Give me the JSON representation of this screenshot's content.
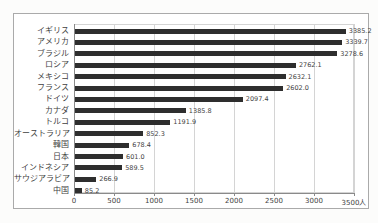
{
  "chart_data": {
    "type": "bar",
    "orientation": "horizontal",
    "title": "",
    "xlabel": "",
    "ylabel": "",
    "categories": [
      "イギリス",
      "アメリカ",
      "ブラジル",
      "ロシア",
      "メキシコ",
      "フランス",
      "ドイツ",
      "カナダ",
      "トルコ",
      "オーストラリア",
      "韓国",
      "日本",
      "インドネシア",
      "サウジアラビア",
      "中国"
    ],
    "values": [
      3385.2,
      3339.7,
      3278.6,
      2762.1,
      2632.1,
      2602.0,
      2097.4,
      1385.8,
      1191.9,
      852.3,
      678.4,
      601.0,
      589.5,
      266.9,
      85.2
    ],
    "value_labels": [
      "3385.2",
      "3339.7",
      "3278.6",
      "2762.1",
      "2632.1",
      "2602.0",
      "2097.4",
      "1385.8",
      "1191.9",
      "852.3",
      "678.4",
      "601.0",
      "589.5",
      "266.9",
      "85.2"
    ],
    "xlim": [
      0,
      3500
    ],
    "x_ticks": [
      0,
      500,
      1000,
      1500,
      2000,
      2500,
      3000,
      3500
    ],
    "x_tick_labels": [
      "0",
      "500",
      "1000",
      "1500",
      "2000",
      "2500",
      "3000",
      "3500人"
    ],
    "grid": true,
    "legend": "none",
    "colors": {
      "bar": "#2e2e2e",
      "grid": "#d4d4d4",
      "axis": "#8a8a8a",
      "frame_border": "#aaaaaa",
      "background": "#ffffff",
      "text": "#3f3f3f"
    }
  }
}
